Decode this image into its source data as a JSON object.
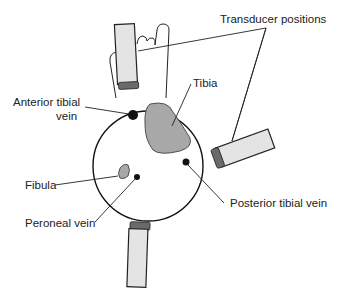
{
  "diagram": {
    "type": "anatomical cross-section",
    "labels": {
      "transducer_positions": "Transducer positions",
      "tibia": "Tibia",
      "anterior_tibial_vein_line1": "Anterior tibial",
      "anterior_tibial_vein_line2": "vein",
      "fibula": "Fibula",
      "peroneal_vein": "Peroneal vein",
      "posterior_tibial_vein": "Posterior tibial vein"
    },
    "colors": {
      "outline": "#111111",
      "bone_fill": "#a8a8a8",
      "transducer_body": "#e4e4e4",
      "transducer_tip": "#6a6a6a",
      "vein": "#111111"
    }
  }
}
